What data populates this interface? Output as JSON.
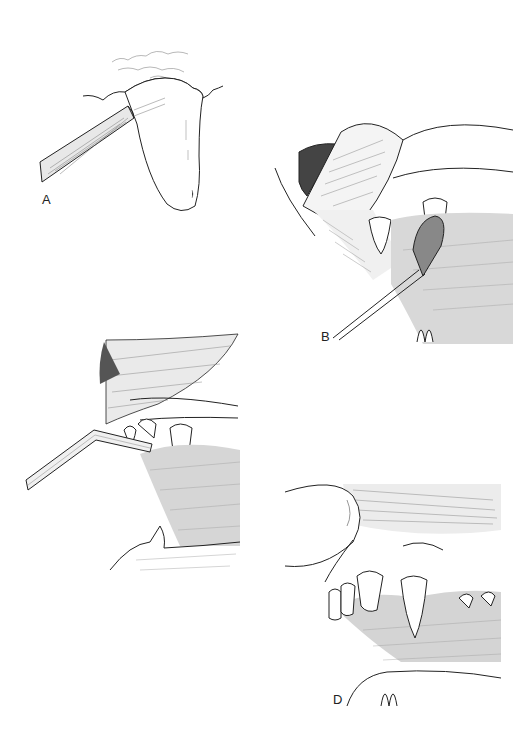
{
  "figure": {
    "panels": [
      {
        "id": "A",
        "label": "A",
        "description": "Probe placed against tooth crown at gingival margin"
      },
      {
        "id": "B",
        "label": "B",
        "description": "Lip retracted, swab applied to canine tooth"
      },
      {
        "id": "C",
        "label": "C",
        "description": "Bent instrument directed at upper teeth with lip retracted"
      },
      {
        "id": "D",
        "label": "D",
        "description": "Thumb retracting lip exposing upper incisors, canine and premolars"
      }
    ],
    "colors": {
      "ink": "#222222",
      "background": "#ffffff",
      "shade": "#555555"
    }
  }
}
